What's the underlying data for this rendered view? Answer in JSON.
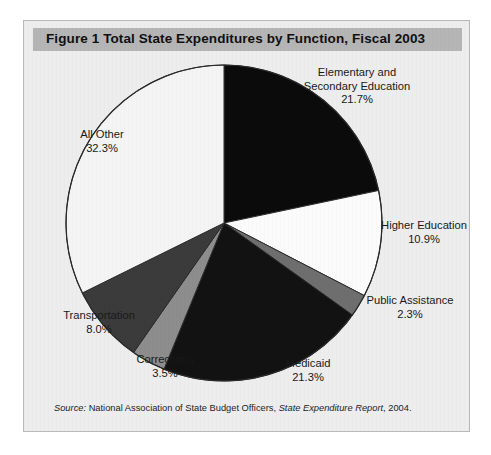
{
  "figure": {
    "title": "Figure 1  Total State Expenditures by Function, Fiscal 2003",
    "source": {
      "label": "Source:",
      "organization": "National Association of State Budget Officers,",
      "publication": "State Expenditure Report",
      "year": ", 2004."
    },
    "colors": {
      "panel_background": "#ededed",
      "title_bar": "#b5b5b5",
      "panel_border": "#b9b9b9",
      "slice_outline": "#2a2a2a"
    }
  },
  "chart_data": {
    "type": "pie",
    "title": "Total State Expenditures by Function, Fiscal 2003",
    "unit": "percent",
    "start_angle_deg": 0,
    "direction": "clockwise",
    "legend": "none (direct labels)",
    "categories": [
      "Elementary and Secondary Education",
      "Higher Education",
      "Public Assistance",
      "Medicaid",
      "Corrections",
      "Transportation",
      "All Other"
    ],
    "values": [
      21.7,
      10.9,
      2.3,
      21.3,
      3.5,
      8.0,
      32.3
    ],
    "slices": [
      {
        "name_line1": "Elementary and",
        "name_line2": "Secondary Education",
        "value_text": "21.7%",
        "value": 21.7,
        "color": "#0b0b0b"
      },
      {
        "name_line1": "Higher Education",
        "name_line2": "",
        "value_text": "10.9%",
        "value": 10.9,
        "color": "#fbfbfb"
      },
      {
        "name_line1": "Public Assistance",
        "name_line2": "",
        "value_text": "2.3%",
        "value": 2.3,
        "color": "#6e6e6e"
      },
      {
        "name_line1": "Medicaid",
        "name_line2": "",
        "value_text": "21.3%",
        "value": 21.3,
        "color": "#121212"
      },
      {
        "name_line1": "Corrections",
        "name_line2": "",
        "value_text": "3.5%",
        "value": 3.5,
        "color": "#8d8d8d"
      },
      {
        "name_line1": "Transportation",
        "name_line2": "",
        "value_text": "8.0%",
        "value": 8.0,
        "color": "#3b3b3b"
      },
      {
        "name_line1": "All Other",
        "name_line2": "",
        "value_text": "32.3%",
        "value": 32.3,
        "color": "#f4f4f4"
      }
    ]
  }
}
